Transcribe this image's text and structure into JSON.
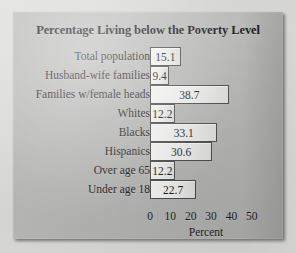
{
  "panel": {
    "background_color": "#b5b5b3",
    "page_background_color": "#dcdcda",
    "bar_border_color": "#4a4a4c",
    "text_color": "#1a1a1c"
  },
  "chart_data": {
    "type": "bar",
    "orientation": "horizontal",
    "title": "Percentage Living below the Poverty Level",
    "xlabel": "Percent",
    "ylabel": "",
    "grid": false,
    "legend": false,
    "xlim": [
      0,
      55
    ],
    "xticks": [
      0,
      10,
      20,
      30,
      40,
      50
    ],
    "xtick_labels": [
      "0",
      "10",
      "20",
      "30",
      "40",
      "50"
    ],
    "categories": [
      "Total population",
      "Husband-wife families",
      "Families w/female heads",
      "Whites",
      "Blacks",
      "Hispanics",
      "Over age 65",
      "Under age 18"
    ],
    "values": [
      15.1,
      9.4,
      38.7,
      12.2,
      33.1,
      30.6,
      12.2,
      22.7
    ],
    "value_labels": [
      "15.1",
      "9.4",
      "38.7",
      "12.2",
      "33.1",
      "30.6",
      "12.2",
      "22.7"
    ]
  }
}
